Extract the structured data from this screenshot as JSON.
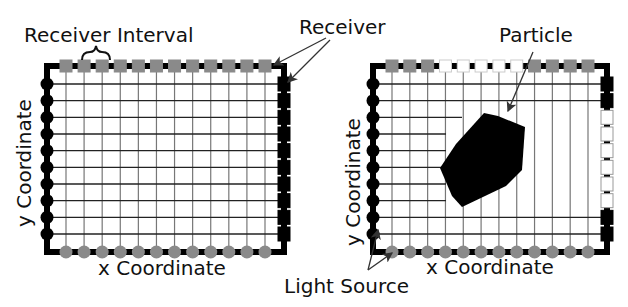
{
  "labels": {
    "receiver_interval": "Receiver Interval",
    "receiver": "Receiver",
    "particle": "Particle",
    "light_source": "Light Source",
    "left_x_axis": "x Coordinate",
    "left_y_axis": "y Coordinate",
    "right_x_axis": "x Coordinate",
    "right_y_axis": "y Coordinate"
  },
  "colors": {
    "frame": "#000000",
    "grid_line": "#777777",
    "grid_line_horizontal": "#222222",
    "receiver_active": "#8a8a8a",
    "receiver_blocked": "#ffffff",
    "light_source_bottom": "#8a8a8a",
    "light_source_left": "#000000",
    "receiver_right": "#000000",
    "particle": "#000000",
    "arrow": "#333333"
  },
  "panels": [
    {
      "id": "left",
      "frame": {
        "x": 47,
        "y": 66,
        "w": 237,
        "h": 186
      },
      "top_receivers": [
        "on",
        "on",
        "on",
        "on",
        "on",
        "on",
        "on",
        "on",
        "on",
        "on",
        "on",
        "on"
      ],
      "right_receivers": [
        "on",
        "on",
        "on",
        "on",
        "on",
        "on",
        "on",
        "on",
        "on",
        "on"
      ],
      "left_sources": 10,
      "bottom_sources": 12,
      "particle": null
    },
    {
      "id": "right",
      "frame": {
        "x": 373,
        "y": 66,
        "w": 234,
        "h": 186
      },
      "top_receivers": [
        "on",
        "on",
        "on",
        "off",
        "off",
        "off",
        "off",
        "off",
        "on",
        "on",
        "on",
        "on"
      ],
      "right_receivers": [
        "on",
        "on",
        "off",
        "off",
        "off",
        "off",
        "off",
        "off",
        "on",
        "on"
      ],
      "left_sources": 10,
      "bottom_sources": 12,
      "particle": {
        "points": [
          [
            484,
            113
          ],
          [
            498,
            116
          ],
          [
            525,
            127
          ],
          [
            522,
            170
          ],
          [
            506,
            186
          ],
          [
            462,
            207
          ],
          [
            452,
            196
          ],
          [
            440,
            168
          ],
          [
            456,
            144
          ]
        ]
      }
    }
  ]
}
